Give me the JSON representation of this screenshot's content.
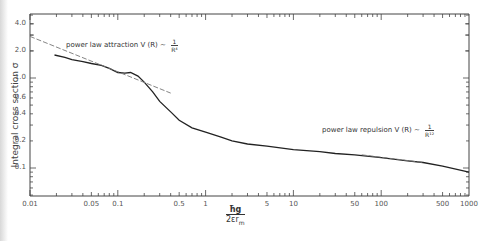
{
  "chart_data": {
    "type": "line",
    "title": "",
    "xlabel": "ħg / 2εr_m",
    "ylabel": "Integral cross section σ",
    "xscale": "log",
    "yscale": "log",
    "xlim": [
      0.01,
      1000
    ],
    "ylim": [
      0.05,
      5.0
    ],
    "grid": false,
    "x_tick_labels": [
      "0.01",
      "0.05",
      "0.1",
      "0.5",
      "1",
      "5",
      "10",
      "50",
      "100",
      "500",
      "1000"
    ],
    "y_tick_labels": [
      "4.0",
      "2.0",
      "1.0",
      "0.6",
      "0.4",
      "0.2",
      "0.1"
    ],
    "series": [
      {
        "name": "Integral cross section (computed)",
        "style": "solid",
        "x": [
          0.019,
          0.025,
          0.03,
          0.04,
          0.05,
          0.065,
          0.08,
          0.1,
          0.12,
          0.14,
          0.17,
          0.2,
          0.25,
          0.3,
          0.4,
          0.5,
          0.7,
          1,
          1.5,
          2,
          3,
          5,
          10,
          20,
          30,
          50,
          100,
          200,
          300,
          500,
          1000
        ],
        "values": [
          1.8,
          1.7,
          1.6,
          1.52,
          1.45,
          1.38,
          1.28,
          1.15,
          1.13,
          1.15,
          1.05,
          0.9,
          0.7,
          0.55,
          0.42,
          0.34,
          0.28,
          0.25,
          0.22,
          0.2,
          0.185,
          0.175,
          0.16,
          0.152,
          0.145,
          0.14,
          0.13,
          0.12,
          0.115,
          0.105,
          0.09
        ]
      },
      {
        "name": "power law attraction V(R) ~ 1/R^4",
        "style": "dashed",
        "x": [
          0.01,
          0.4
        ],
        "values": [
          2.9,
          0.68
        ]
      },
      {
        "name": "power law repulsion V(R) ~ 1/R^12",
        "style": "dashed",
        "x": [
          60,
          300
        ],
        "values": [
          0.14,
          0.115
        ]
      }
    ],
    "annotations": [
      {
        "text": "power law attraction  V(R) ~ 1/R^4",
        "x": 0.022,
        "y": 2.0
      },
      {
        "text": "power law repulsion  V(R) ~ 1/R^12",
        "x": 35,
        "y": 0.2
      }
    ]
  },
  "labels": {
    "ylabel": "Integral cross section σ",
    "xlabel_num": "ħg",
    "xlabel_den": "2εr",
    "xlabel_sub": "m",
    "attraction_text": "power law attraction  V (R) ~",
    "attraction_num": "1",
    "attraction_den": "R⁴",
    "repulsion_text": "power law repulsion  V (R) ~",
    "repulsion_num": "1",
    "repulsion_den": "R¹²"
  }
}
